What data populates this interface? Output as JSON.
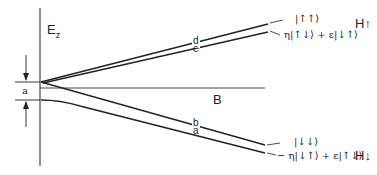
{
  "diagram": {
    "axes": {
      "y_label": "E",
      "y_label_sub": "z",
      "x_label": "B"
    },
    "gap_label": "a",
    "level_labels": {
      "d": "d",
      "c": "c",
      "b": "b",
      "a": "a"
    },
    "states": {
      "upper_top": "|↑↑⟩",
      "upper_mixed": "η|↑↓⟩ + ε|↓↑⟩",
      "lower_top": "|↓↓⟩",
      "lower_mixed": "− η|↓↑⟩ + ε|↑↓⟩"
    },
    "group_labels": {
      "upper": "H↑",
      "lower": "H↓"
    },
    "colors": {
      "line": "#222222",
      "background": "#ffffff"
    }
  }
}
